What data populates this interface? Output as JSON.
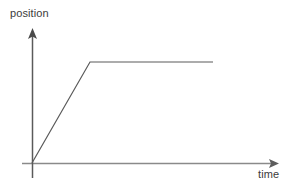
{
  "figure": {
    "background_color": "#ffffff",
    "width": 292,
    "height": 186,
    "y_axis_label": "position",
    "x_axis_label": "time",
    "axis_color": "#6e6e6e",
    "curve_color": "#555555",
    "label_color": "#3b3b3b"
  },
  "chart_data": {
    "type": "line",
    "title": "",
    "xlabel": "time",
    "ylabel": "position",
    "grid": false,
    "legend": null,
    "axis_arrows": {
      "x": "right",
      "y": "up"
    },
    "tick_labels": {
      "x": [],
      "y": []
    },
    "xlim": [
      0,
      1
    ],
    "ylim": [
      0,
      1
    ],
    "series": [
      {
        "name": "position vs time",
        "x": [
          0.0,
          0.234,
          0.722
        ],
        "y": [
          0.0,
          0.748,
          0.748
        ],
        "description": "Linear increase from origin to a knee, then constant horizontal plateau"
      }
    ],
    "annotations": []
  },
  "geometry": {
    "origin": {
      "x": 32,
      "y": 163
    },
    "y_axis": {
      "x": 32,
      "top": 28,
      "bottom": 178
    },
    "x_axis": {
      "y": 163,
      "left": 22,
      "right": 278
    },
    "curve_points": "32,163 90,62 213,62"
  }
}
